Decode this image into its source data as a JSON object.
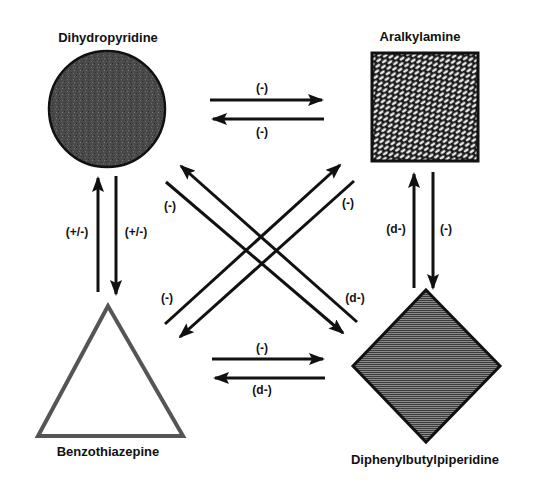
{
  "diagram": {
    "nodes": {
      "dihydropyridine": {
        "label": "Dihydropyridine",
        "shape": "circle",
        "fill": "dark stippled gray"
      },
      "aralkylamine": {
        "label": "Aralkylamine",
        "shape": "square",
        "fill": "brick/crosshatch pattern"
      },
      "benzothiazepine": {
        "label": "Benzothiazepine",
        "shape": "triangle",
        "fill": "white (outlined)"
      },
      "diphenylbutylpiperidine": {
        "label": "Diphenylbutylpiperidine",
        "shape": "diamond",
        "fill": "horizontal line hatch"
      }
    },
    "edges": {
      "dhp_to_ara": {
        "from": "Dihydropyridine",
        "to": "Aralkylamine",
        "label": "(-)"
      },
      "ara_to_dhp": {
        "from": "Aralkylamine",
        "to": "Dihydropyridine",
        "label": "(-)"
      },
      "btz_to_dhp": {
        "from": "Benzothiazepine",
        "to": "Dihydropyridine",
        "label": "(+/-)"
      },
      "dhp_to_btz": {
        "from": "Dihydropyridine",
        "to": "Benzothiazepine",
        "label": "(+/-)"
      },
      "dpbp_to_ara": {
        "from": "Diphenylbutylpiperidine",
        "to": "Aralkylamine",
        "label": "(d-)"
      },
      "ara_to_dpbp": {
        "from": "Aralkylamine",
        "to": "Diphenylbutylpiperidine",
        "label": "(-)"
      },
      "btz_to_dpbp": {
        "from": "Benzothiazepine",
        "to": "Diphenylbutylpiperidine",
        "label": "(-)"
      },
      "dpbp_to_btz": {
        "from": "Diphenylbutylpiperidine",
        "to": "Benzothiazepine",
        "label": "(d-)"
      },
      "dhp_to_dpbp": {
        "from": "Dihydropyridine",
        "to": "Diphenylbutylpiperidine",
        "label": "(-)"
      },
      "dpbp_to_dhp": {
        "from": "Diphenylbutylpiperidine",
        "to": "Dihydropyridine",
        "label": "(d-)"
      },
      "btz_to_ara": {
        "from": "Benzothiazepine",
        "to": "Aralkylamine",
        "label": "(-)"
      },
      "ara_to_btz": {
        "from": "Aralkylamine",
        "to": "Benzothiazepine",
        "label": "(-)"
      }
    }
  }
}
